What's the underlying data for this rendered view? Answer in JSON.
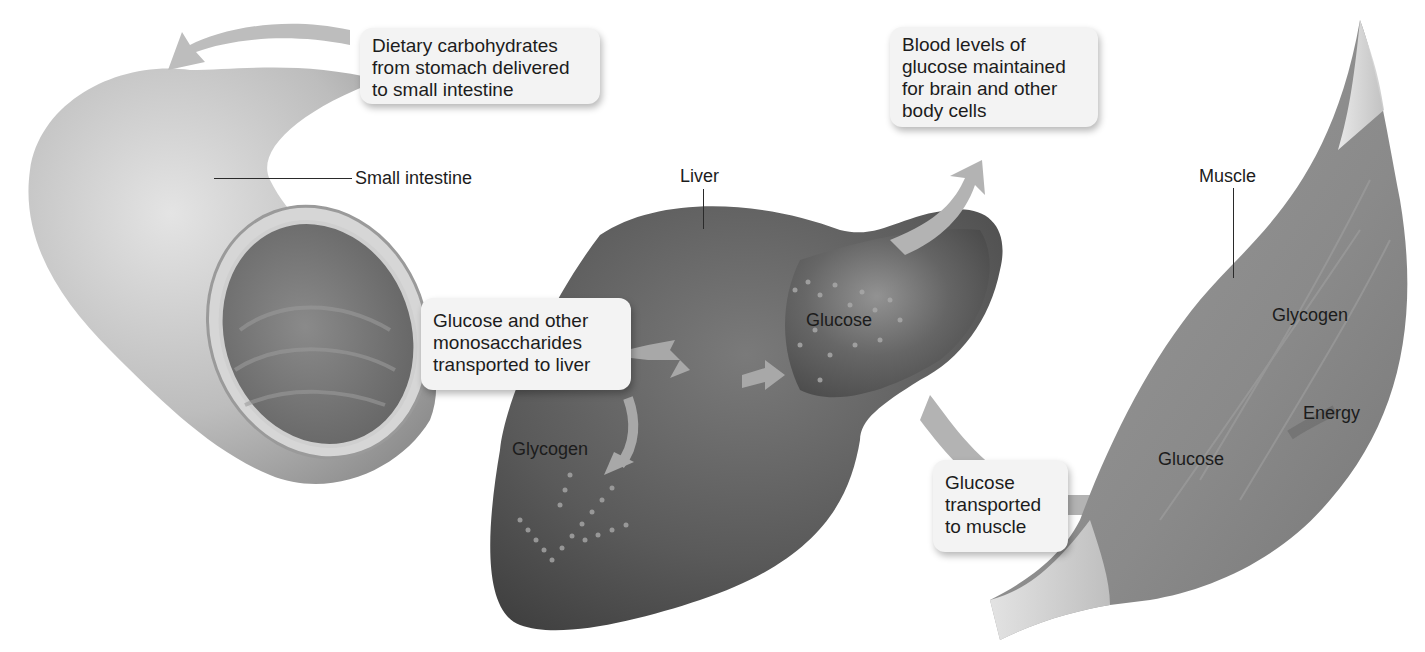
{
  "diagram": {
    "colors": {
      "background": "#ffffff",
      "callout_fill": "#f3f3f3",
      "intestine": "#b9b9b9",
      "liver": "#5c5c5c",
      "muscle": "#8a8a8a",
      "arrow": "#a8a8a8",
      "text": "#1c1c1c"
    },
    "callouts": {
      "dietary": "Dietary carbohydrates\nfrom stomach delivered\nto small intestine",
      "blood": "Blood levels of\nglucose maintained\nfor brain and other\nbody cells",
      "to_liver": "Glucose and other\nmonosaccharides\ntransported to liver",
      "to_muscle": "Glucose\ntransported\nto muscle"
    },
    "labels": {
      "small_intestine": "Small intestine",
      "liver": "Liver",
      "liver_glucose": "Glucose",
      "liver_glycogen": "Glycogen",
      "muscle": "Muscle",
      "muscle_glycogen": "Glycogen",
      "muscle_energy": "Energy",
      "muscle_glucose": "Glucose"
    }
  }
}
